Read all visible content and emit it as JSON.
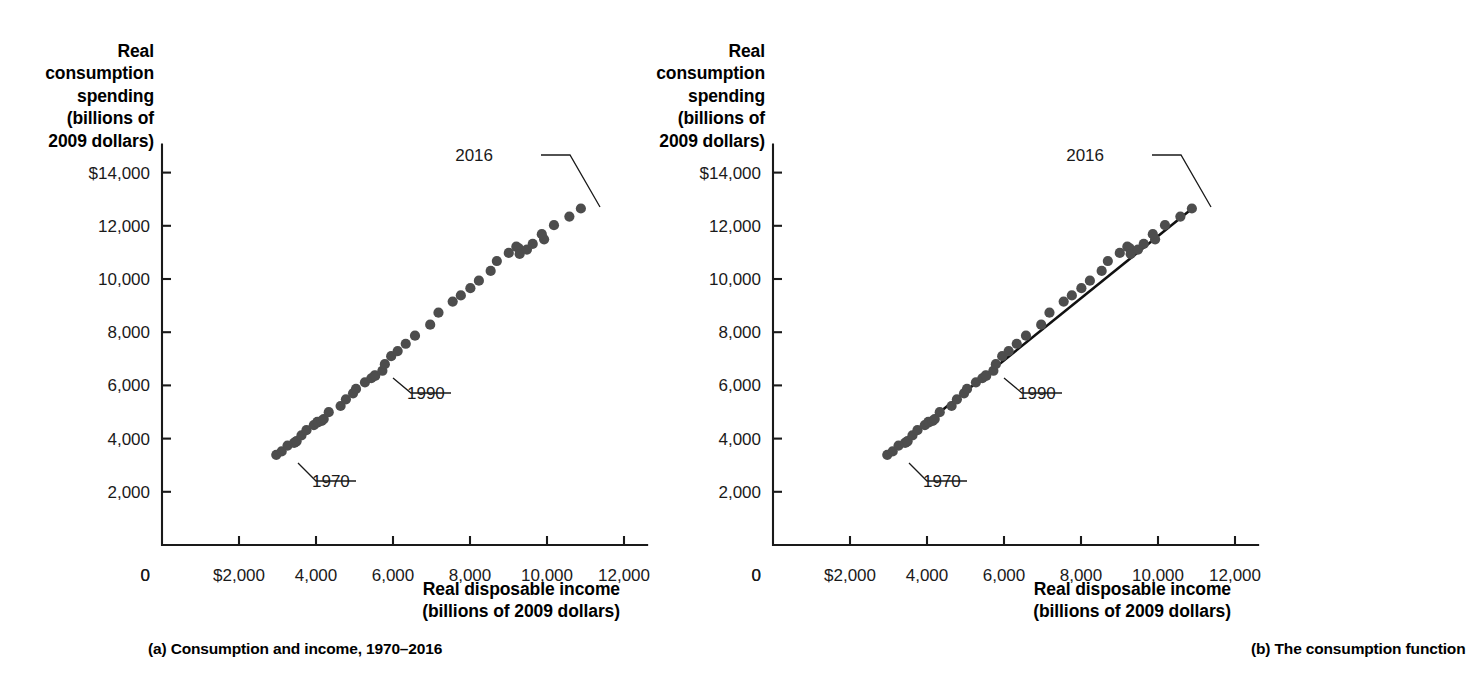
{
  "figure": {
    "background_color": "#ffffff",
    "dot_color": "#4d4d4d",
    "axis_color": "#1a1a1a",
    "fit_line_color": "#111111"
  },
  "panels": [
    {
      "id": "a",
      "caption": "(a) Consumption and income, 1970–2016",
      "ylabel_lines": [
        "Real",
        "consumption",
        "spending",
        "(billions of",
        "2009 dollars)"
      ],
      "xlabel_lines": [
        "Real disposable income",
        "(billions of 2009 dollars)"
      ],
      "show_fit_line": false,
      "annotations": [
        {
          "label": "1970",
          "text_x": 312,
          "text_y": 487,
          "leader": "298,463 L 316,481 L 356,481"
        },
        {
          "label": "1990",
          "text_x": 407,
          "text_y": 399,
          "leader": "393,378 L 411,393 L 451,393"
        },
        {
          "label": "2016",
          "text_x": 493,
          "text_y": 161,
          "leader": "541,155 L 570,155 L 600,207"
        }
      ]
    },
    {
      "id": "b",
      "caption": "(b) The consumption function",
      "ylabel_lines": [
        "Real",
        "consumption",
        "spending",
        "(billions of",
        "2009 dollars)"
      ],
      "xlabel_lines": [
        "Real disposable income",
        "(billions of 2009 dollars)"
      ],
      "show_fit_line": true,
      "annotations": [
        {
          "label": "1970",
          "text_x": 312,
          "text_y": 487,
          "leader": "298,463 L 316,481 L 356,481"
        },
        {
          "label": "1990",
          "text_x": 407,
          "text_y": 399,
          "leader": "393,378 L 411,393 L 451,393"
        },
        {
          "label": "2016",
          "text_x": 493,
          "text_y": 161,
          "leader": "541,155 L 570,155 L 600,207"
        }
      ]
    }
  ],
  "chart_data": {
    "type": "scatter",
    "title": "",
    "xlabel": "Real disposable income (billions of 2009 dollars)",
    "ylabel": "Real consumption spending (billions of 2009 dollars)",
    "xlim": [
      0,
      12800
    ],
    "ylim": [
      0,
      14800
    ],
    "x_ticks": [
      0,
      2000,
      4000,
      6000,
      8000,
      10000,
      12000
    ],
    "x_tick_labels": [
      "0",
      "$2,000",
      "4,000",
      "6,000",
      "8,000",
      "10,000",
      "12,000"
    ],
    "y_ticks": [
      0,
      2000,
      4000,
      6000,
      8000,
      10000,
      12000,
      14000
    ],
    "y_tick_labels": [
      "0",
      "2,000",
      "4,000",
      "6,000",
      "8,000",
      "10,000",
      "12,000",
      "$14,000"
    ],
    "grid": false,
    "legend": "none",
    "series": [
      {
        "name": "Consumption vs. disposable income, 1970–2016",
        "point_labels": [
          "1970",
          "1990",
          "2016"
        ],
        "points": [
          {
            "year": 1970,
            "x": 2968,
            "y": 3389
          },
          {
            "year": 1971,
            "x": 3109,
            "y": 3518
          },
          {
            "year": 1972,
            "x": 3261,
            "y": 3736
          },
          {
            "year": 1973,
            "x": 3477,
            "y": 3878
          },
          {
            "year": 1974,
            "x": 3432,
            "y": 3838
          },
          {
            "year": 1975,
            "x": 3496,
            "y": 3904
          },
          {
            "year": 1976,
            "x": 3622,
            "y": 4118
          },
          {
            "year": 1977,
            "x": 3752,
            "y": 4318
          },
          {
            "year": 1978,
            "x": 3943,
            "y": 4506
          },
          {
            "year": 1979,
            "x": 4035,
            "y": 4629
          },
          {
            "year": 1980,
            "x": 4050,
            "y": 4611
          },
          {
            "year": 1981,
            "x": 4148,
            "y": 4665
          },
          {
            "year": 1982,
            "x": 4200,
            "y": 4736
          },
          {
            "year": 1983,
            "x": 4331,
            "y": 4995
          },
          {
            "year": 1984,
            "x": 4639,
            "y": 5226
          },
          {
            "year": 1985,
            "x": 4777,
            "y": 5477
          },
          {
            "year": 1986,
            "x": 4962,
            "y": 5703
          },
          {
            "year": 1987,
            "x": 5039,
            "y": 5866
          },
          {
            "year": 1988,
            "x": 5271,
            "y": 6115
          },
          {
            "year": 1989,
            "x": 5437,
            "y": 6269
          },
          {
            "year": 1990,
            "x": 5527,
            "y": 6377
          },
          {
            "year": 1991,
            "x": 5536,
            "y": 6358
          },
          {
            "year": 1992,
            "x": 5724,
            "y": 6550
          },
          {
            "year": 1993,
            "x": 5788,
            "y": 6798
          },
          {
            "year": 1994,
            "x": 5953,
            "y": 7098
          },
          {
            "year": 1995,
            "x": 6121,
            "y": 7289
          },
          {
            "year": 1996,
            "x": 6331,
            "y": 7565
          },
          {
            "year": 1997,
            "x": 6571,
            "y": 7869
          },
          {
            "year": 1998,
            "x": 6966,
            "y": 8283
          },
          {
            "year": 1999,
            "x": 7181,
            "y": 8734
          },
          {
            "year": 2000,
            "x": 7550,
            "y": 9151
          },
          {
            "year": 2001,
            "x": 7762,
            "y": 9381
          },
          {
            "year": 2002,
            "x": 8010,
            "y": 9654
          },
          {
            "year": 2003,
            "x": 8231,
            "y": 9937
          },
          {
            "year": 2004,
            "x": 8537,
            "y": 10302
          },
          {
            "year": 2005,
            "x": 8697,
            "y": 10676
          },
          {
            "year": 2006,
            "x": 9007,
            "y": 10980
          },
          {
            "year": 2007,
            "x": 9203,
            "y": 11216
          },
          {
            "year": 2008,
            "x": 9268,
            "y": 11148
          },
          {
            "year": 2009,
            "x": 9290,
            "y": 10940
          },
          {
            "year": 2010,
            "x": 9479,
            "y": 11107
          },
          {
            "year": 2011,
            "x": 9629,
            "y": 11319
          },
          {
            "year": 2012,
            "x": 9925,
            "y": 11491
          },
          {
            "year": 2013,
            "x": 9865,
            "y": 11684
          },
          {
            "year": 2014,
            "x": 10181,
            "y": 12023
          },
          {
            "year": 2015,
            "x": 10581,
            "y": 12346
          },
          {
            "year": 2016,
            "x": 10880,
            "y": 12650
          }
        ]
      }
    ],
    "fit_line": {
      "description": "The consumption function (fitted line through the scatter)",
      "x_start": 2968,
      "y_start": 3400,
      "x_end": 10880,
      "y_end": 12640,
      "shown_in_panel": "b"
    }
  }
}
